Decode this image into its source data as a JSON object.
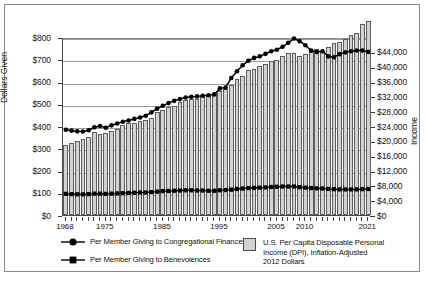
{
  "chart_data": {
    "type": "bar",
    "title": "",
    "subtitle": "",
    "xlabel": "",
    "ylabel": "Dollars Given",
    "ylabel_secondary": "Income",
    "ylim": [
      0,
      800
    ],
    "ylim_secondary": [
      0,
      48000
    ],
    "grid": true,
    "legend_position": "below",
    "x": [
      1968,
      1969,
      1970,
      1971,
      1972,
      1973,
      1974,
      1975,
      1976,
      1977,
      1978,
      1979,
      1980,
      1981,
      1982,
      1983,
      1984,
      1985,
      1986,
      1987,
      1988,
      1989,
      1990,
      1991,
      1992,
      1993,
      1994,
      1995,
      1996,
      1997,
      1998,
      1999,
      2000,
      2001,
      2002,
      2003,
      2004,
      2005,
      2006,
      2007,
      2008,
      2009,
      2010,
      2011,
      2012,
      2013,
      2014,
      2015,
      2016,
      2017,
      2018,
      2019,
      2020,
      2021
    ],
    "categories": [
      "1968",
      "1969",
      "1970",
      "1971",
      "1972",
      "1973",
      "1974",
      "1975",
      "1976",
      "1977",
      "1978",
      "1979",
      "1980",
      "1981",
      "1982",
      "1983",
      "1984",
      "1985",
      "1986",
      "1987",
      "1988",
      "1989",
      "1990",
      "1991",
      "1992",
      "1993",
      "1994",
      "1995",
      "1996",
      "1997",
      "1998",
      "1999",
      "2000",
      "2001",
      "2002",
      "2003",
      "2004",
      "2005",
      "2006",
      "2007",
      "2008",
      "2009",
      "2010",
      "2011",
      "2012",
      "2013",
      "2014",
      "2015",
      "2016",
      "2017",
      "2018",
      "2019",
      "2020",
      "2021"
    ],
    "xticks": [
      1968,
      1975,
      1985,
      1995,
      2005,
      2010,
      2021
    ],
    "xticklabels": [
      "1968",
      "1975",
      "1985",
      "1995",
      "2005",
      "2010",
      "2021"
    ],
    "yticks": [
      0,
      100,
      200,
      300,
      400,
      500,
      600,
      700,
      800
    ],
    "yticklabels": [
      "$0",
      "$100",
      "$200",
      "$300",
      "$400",
      "$500",
      "$600",
      "$700",
      "$800"
    ],
    "yticks_secondary": [
      0,
      4000,
      8000,
      12000,
      16000,
      20000,
      24000,
      28000,
      32000,
      36000,
      40000,
      44000
    ],
    "yticklabels_secondary": [
      "$0",
      "$4,000",
      "$8,000",
      "$12,000",
      "$16,000",
      "$20,000",
      "$24,000",
      "$28,000",
      "$32,000",
      "$36,000",
      "$40,000",
      "$44,000"
    ],
    "series": [
      {
        "name": "U.S. Per Capita Disposable Personal Income (DPI), Inflation-Adjusted 2012 Dollars",
        "short_name": "DPI",
        "type": "bar",
        "axis": "right",
        "color": "#d2d2d2",
        "edge_color": "#5d5d5d",
        "values": [
          18900,
          19350,
          19950,
          20400,
          21150,
          22350,
          21950,
          22250,
          22800,
          23300,
          24250,
          24800,
          24700,
          25250,
          25500,
          26200,
          27700,
          28250,
          29100,
          29450,
          30500,
          31100,
          31400,
          31200,
          32100,
          32200,
          32800,
          33400,
          34100,
          35000,
          36700,
          37500,
          39000,
          39300,
          40150,
          40800,
          41650,
          41900,
          42900,
          43600,
          43800,
          43000,
          43400,
          43900,
          44800,
          44200,
          45400,
          46400,
          46800,
          47400,
          48600,
          49200,
          51500,
          52400
        ]
      },
      {
        "name": "Per Member Giving to Congregational Finances",
        "short_name": "Congregational Finances",
        "type": "line",
        "marker": "circle",
        "axis": "left",
        "color": "#000000",
        "values": [
          392,
          388,
          385,
          384,
          390,
          403,
          409,
          401,
          412,
          420,
          428,
          434,
          441,
          447,
          455,
          470,
          487,
          500,
          512,
          522,
          530,
          537,
          540,
          542,
          545,
          547,
          551,
          578,
          582,
          625,
          655,
          682,
          702,
          715,
          722,
          733,
          745,
          752,
          765,
          783,
          802,
          790,
          772,
          748,
          742,
          745,
          722,
          718,
          732,
          740,
          745,
          748,
          748,
          742
        ]
      },
      {
        "name": "Per Member Giving to Benevolences",
        "short_name": "Benevolences",
        "type": "line",
        "marker": "square",
        "axis": "left",
        "color": "#000000",
        "values": [
          104,
          103,
          102,
          102,
          103,
          105,
          105,
          104,
          105,
          106,
          107,
          108,
          109,
          110,
          110,
          112,
          114,
          116,
          117,
          118,
          119,
          120,
          120,
          119,
          119,
          118,
          118,
          120,
          121,
          123,
          126,
          128,
          130,
          131,
          132,
          133,
          135,
          136,
          137,
          137,
          137,
          134,
          132,
          130,
          129,
          128,
          126,
          125,
          124,
          124,
          124,
          124,
          125,
          126
        ]
      }
    ]
  },
  "legend": {
    "items": [
      {
        "marker": "circle-line-marker",
        "label": "Per Member Giving to  Congregational Finances"
      },
      {
        "marker": "square-line-marker",
        "label": "Per Member Giving to  Benevolences"
      }
    ],
    "bar_item": {
      "marker": "gray-square-swatch",
      "lines": [
        "U.S. Per Capita Disposable Personal",
        "Income (DPI), Inflation-Adjusted",
        "2012 Dollars"
      ]
    }
  },
  "axes": {
    "left_title": "Dollars Given",
    "right_title": "Income"
  }
}
